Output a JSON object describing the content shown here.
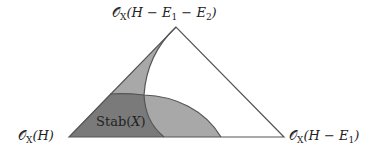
{
  "diagram": {
    "type": "triangle-chamber-diagram",
    "vertices": {
      "top": {
        "label": "𝒪",
        "sub": "X",
        "arg": "(H − E",
        "arg_sub1": "1",
        "arg_mid": " − E",
        "arg_sub2": "2",
        "arg_end": ")"
      },
      "left": {
        "label": "𝒪",
        "sub": "X",
        "arg": "(H)"
      },
      "right": {
        "label": "𝒪",
        "sub": "X",
        "arg": "(H − E",
        "arg_sub1": "1",
        "arg_end": ")"
      }
    },
    "region_label": {
      "main": "Stab(",
      "var": "X",
      "end": ")"
    },
    "colors": {
      "dark_region": "#7a7a7a",
      "light_region": "#a8a8a8",
      "edge": "#555555",
      "background": "#ffffff"
    }
  }
}
